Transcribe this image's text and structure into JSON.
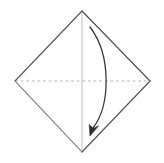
{
  "figure": {
    "kind": "origami-fold-diagram",
    "canvas": {
      "width": 164,
      "height": 163,
      "background": "#ffffff"
    },
    "shape": {
      "name": "diamond-square",
      "vertices": {
        "top": {
          "x": 82,
          "y": 11
        },
        "right": {
          "x": 150,
          "y": 81
        },
        "bottom": {
          "x": 82,
          "y": 152
        },
        "left": {
          "x": 15,
          "y": 81
        }
      },
      "edges": [
        {
          "name": "edge-top-left",
          "from": "left",
          "to": "top",
          "color": "#565656",
          "width": 1.15,
          "style": "solid"
        },
        {
          "name": "edge-top-right",
          "from": "top",
          "to": "right",
          "color": "#4f4f4f",
          "width": 1.15,
          "style": "solid"
        },
        {
          "name": "edge-bottom-right",
          "from": "right",
          "to": "bottom",
          "color": "#535353",
          "width": 1.15,
          "style": "solid"
        },
        {
          "name": "edge-bottom-left",
          "from": "bottom",
          "to": "left",
          "color": "#8d8d8d",
          "width": 1.1,
          "style": "solid"
        }
      ]
    },
    "creases": [
      {
        "name": "vertical-center-crease",
        "label": "vertical center line",
        "from": {
          "x": 82,
          "y": 11
        },
        "to": {
          "x": 82,
          "y": 152
        },
        "color": "#c9c9c9",
        "width": 1.2,
        "style": "solid"
      },
      {
        "name": "horizontal-center-crease",
        "label": "horizontal dashed fold line",
        "from": {
          "x": 15,
          "y": 81
        },
        "to": {
          "x": 150,
          "y": 81
        },
        "color": "#b9b9b9",
        "width": 1,
        "style": "dashed",
        "dash_pattern": "3,2.6"
      }
    ],
    "arrow": {
      "name": "fold-arrow",
      "label": "curved fold direction arrow",
      "color": "#3a3a3a",
      "width": 1.3,
      "start": {
        "x": 90,
        "y": 27
      },
      "control1": {
        "x": 112,
        "y": 56
      },
      "control2": {
        "x": 110,
        "y": 106
      },
      "end": {
        "x": 93,
        "y": 128
      },
      "head": {
        "name": "arrowhead",
        "tip": {
          "x": 90,
          "y": 136
        },
        "points": "90,136 89.2,124.6 93.4,128.4 98.6,125.8",
        "color": "#2e2e2e"
      }
    }
  }
}
